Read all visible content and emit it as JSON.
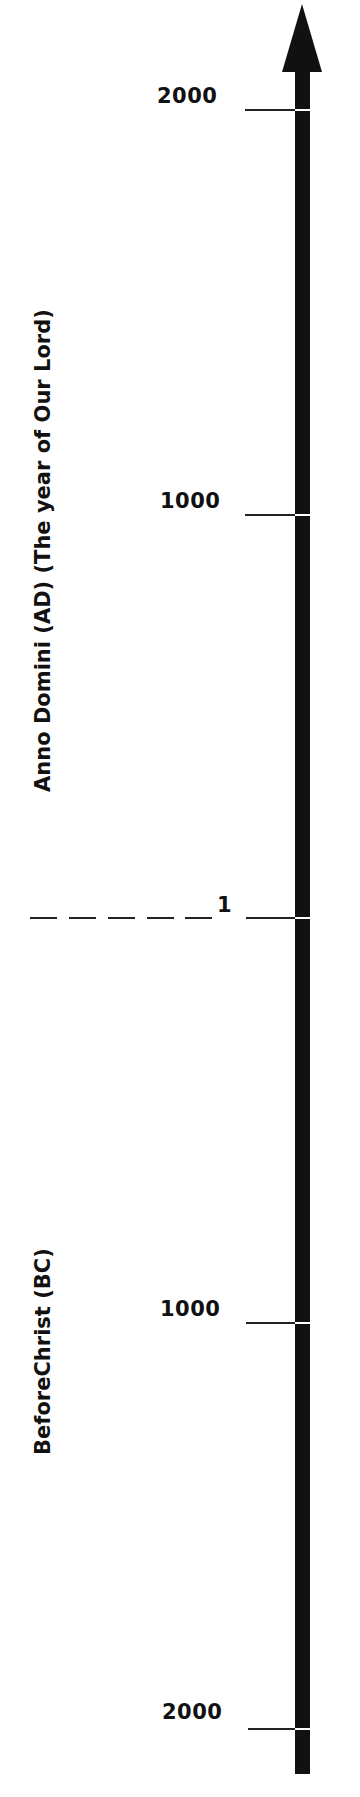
{
  "diagram": {
    "type": "timeline",
    "orientation": "vertical",
    "arrow_direction": "up",
    "ticks": [
      {
        "label": "2000",
        "era": "AD",
        "y": 110
      },
      {
        "label": "1000",
        "era": "AD",
        "y": 515
      },
      {
        "label": "1",
        "era": "AD",
        "y": 918
      },
      {
        "label": "1000",
        "era": "BC",
        "y": 1323
      },
      {
        "label": "2000",
        "era": "BC",
        "y": 1729
      }
    ],
    "eras": {
      "ad": "Anno Domini (AD) (The year of Our Lord)",
      "bc": "BeforeChrist (BC)"
    },
    "colors": {
      "line": "#111111",
      "background": "#ffffff"
    }
  }
}
